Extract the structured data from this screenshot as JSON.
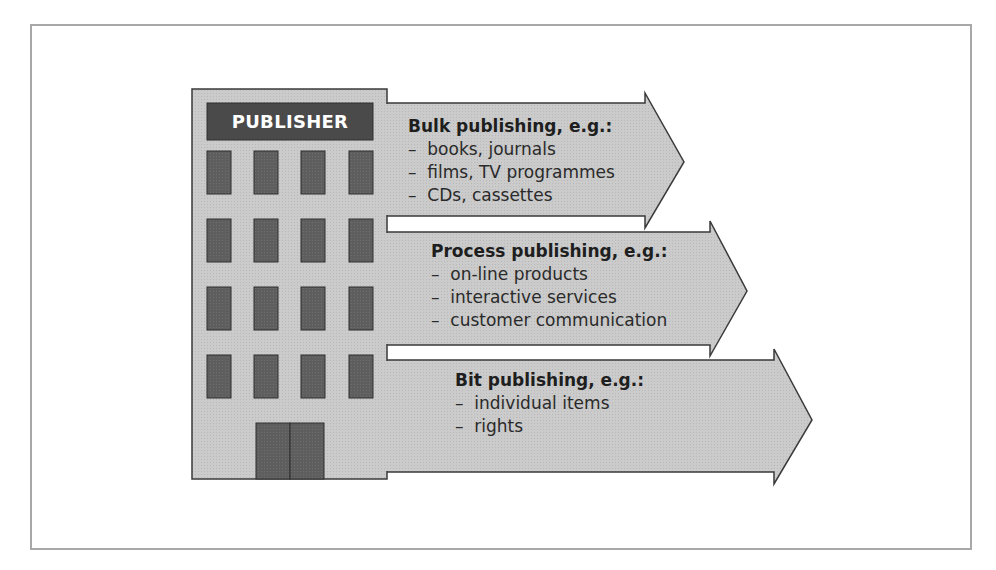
{
  "diagram": {
    "building": {
      "sign_label": "PUBLISHER",
      "window_rows": 4,
      "window_columns": 4,
      "has_door": true
    },
    "arrows": [
      {
        "title": "Bulk publishing, e.g.:",
        "items": [
          "books, journals",
          "films, TV programmes",
          "CDs, cassettes"
        ]
      },
      {
        "title": "Process publishing, e.g.:",
        "items": [
          "on-line products",
          "interactive services",
          "customer communication"
        ]
      },
      {
        "title": "Bit publishing, e.g.:",
        "items": [
          "individual items",
          "rights"
        ]
      }
    ],
    "colors": {
      "fill_gray": "#c9c9c9",
      "window_dark": "#5c5c5c",
      "sign_dark": "#4a4a4a",
      "outline": "#3a3a3a",
      "frame": "#a8a8a8"
    }
  }
}
